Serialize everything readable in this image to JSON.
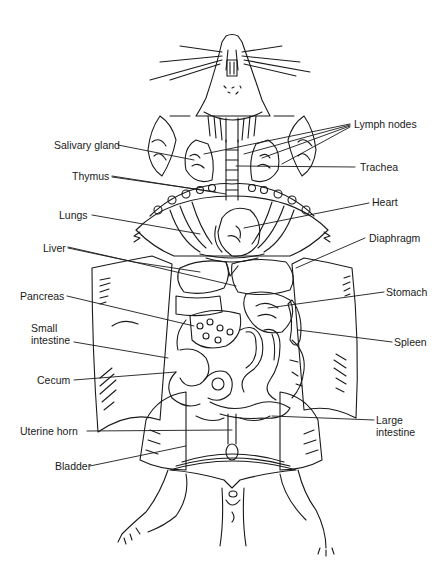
{
  "figure": {
    "colors": {
      "ink": "#1a1a1a",
      "background": "#ffffff"
    }
  },
  "labels": {
    "left": [
      {
        "id": "salivary-gland",
        "text": "Salivary gland"
      },
      {
        "id": "thymus",
        "text": "Thymus"
      },
      {
        "id": "lungs",
        "text": "Lungs"
      },
      {
        "id": "liver",
        "text": "Liver"
      },
      {
        "id": "pancreas",
        "text": "Pancreas"
      },
      {
        "id": "small-intestine",
        "line1": "Small",
        "line2": "intestine"
      },
      {
        "id": "cecum",
        "text": "Cecum"
      },
      {
        "id": "uterine-horn",
        "text": "Uterine horn"
      },
      {
        "id": "bladder",
        "text": "Bladder"
      }
    ],
    "right": [
      {
        "id": "lymph-nodes",
        "text": "Lymph nodes"
      },
      {
        "id": "trachea",
        "text": "Trachea"
      },
      {
        "id": "heart",
        "text": "Heart"
      },
      {
        "id": "diaphragm",
        "text": "Diaphragm"
      },
      {
        "id": "stomach",
        "text": "Stomach"
      },
      {
        "id": "spleen",
        "text": "Spleen"
      },
      {
        "id": "large-intestine",
        "line1": "Large",
        "line2": "intestine"
      }
    ]
  }
}
